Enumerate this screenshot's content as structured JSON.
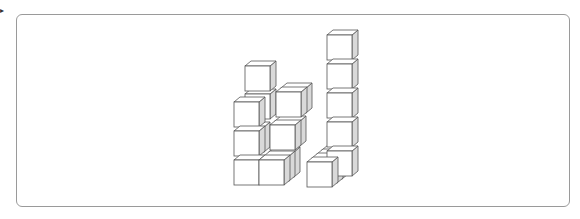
{
  "figure": {
    "marker_glyph": "▸",
    "frame": {
      "x": 16,
      "y": 14,
      "width": 554,
      "height": 193,
      "border_color": "#9a9a9a"
    },
    "cube": {
      "size": 25,
      "depth_dx": 5,
      "depth_dy": -4
    },
    "colors": {
      "front": "#ffffff",
      "top": "#ffffff",
      "side": "#d9d9d9",
      "stroke": "#555555"
    },
    "cubes": [
      {
        "x": 234,
        "y": 160,
        "d": 0
      },
      {
        "x": 259,
        "y": 160,
        "d": 0
      },
      {
        "x": 234,
        "y": 131,
        "d": 0
      },
      {
        "x": 259,
        "y": 160,
        "d": 1
      },
      {
        "x": 259,
        "y": 160,
        "d": 2
      },
      {
        "x": 234,
        "y": 131,
        "d": 1
      },
      {
        "x": 234,
        "y": 102,
        "d": 0
      },
      {
        "x": 240,
        "y": 98,
        "d": 1
      },
      {
        "x": 245,
        "y": 66,
        "d": 0
      },
      {
        "x": 270,
        "y": 125,
        "d": 0
      },
      {
        "x": 270,
        "y": 125,
        "d": 1
      },
      {
        "x": 276,
        "y": 92,
        "d": 0
      },
      {
        "x": 276,
        "y": 92,
        "d": 1
      },
      {
        "x": 307,
        "y": 162,
        "d": 0
      },
      {
        "x": 307,
        "y": 162,
        "d": 1
      },
      {
        "x": 307,
        "y": 162,
        "d": 2
      },
      {
        "x": 307,
        "y": 162,
        "d": 3
      },
      {
        "x": 327,
        "y": 151,
        "d": 0
      },
      {
        "x": 327,
        "y": 122,
        "d": 0
      },
      {
        "x": 327,
        "y": 93,
        "d": 0
      },
      {
        "x": 327,
        "y": 64,
        "d": 0
      },
      {
        "x": 327,
        "y": 35,
        "d": 0
      }
    ]
  }
}
